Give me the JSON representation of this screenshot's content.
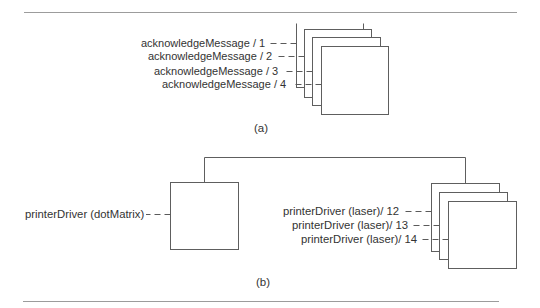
{
  "colors": {
    "line": "#5e5e5e",
    "text": "#333333",
    "rule": "#9c9c9c",
    "background": "#ffffff"
  },
  "figure": {
    "part_a": {
      "caption": "(a)",
      "labels": [
        {
          "text": "acknowledgeMessage / 1"
        },
        {
          "text": "acknowledgeMessage / 2"
        },
        {
          "text": "acknowledgeMessage / 3"
        },
        {
          "text": "acknowledgeMessage / 4"
        }
      ],
      "object_box_count": 4
    },
    "part_b": {
      "caption": "(b)",
      "single_object": {
        "text": "printerDriver (dotMatrix)"
      },
      "multi_objects": [
        {
          "text": "printerDriver (laser)/ 12"
        },
        {
          "text": "printerDriver (laser)/ 13"
        },
        {
          "text": "printerDriver (laser)/ 14"
        }
      ],
      "object_box_count": 3
    }
  }
}
